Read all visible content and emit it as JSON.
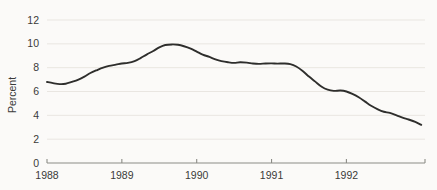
{
  "chart_data": {
    "type": "line",
    "title": "",
    "subtitle": "",
    "xlabel": "",
    "ylabel": "Percent",
    "xlim": [
      1988.0,
      1993.05
    ],
    "ylim": [
      0,
      12
    ],
    "grid": true,
    "legend": false,
    "legend_position": "none",
    "y_ticks": [
      0,
      2,
      4,
      6,
      8,
      10,
      12
    ],
    "y_tick_labels": [
      "0",
      "2",
      "4",
      "6",
      "8",
      "10",
      "12"
    ],
    "x_ticks": [
      1988,
      1989,
      1990,
      1991,
      1992
    ],
    "x_tick_labels": [
      "1988",
      "1989",
      "1990",
      "1991",
      "1992"
    ],
    "series": [
      {
        "name": "Percent",
        "color": "#2e2e2c",
        "x": [
          1988.0,
          1988.08,
          1988.17,
          1988.25,
          1988.33,
          1988.42,
          1988.5,
          1988.58,
          1988.67,
          1988.75,
          1988.83,
          1988.92,
          1989.0,
          1989.08,
          1989.17,
          1989.25,
          1989.33,
          1989.42,
          1989.5,
          1989.58,
          1989.67,
          1989.75,
          1989.83,
          1989.92,
          1990.0,
          1990.08,
          1990.17,
          1990.25,
          1990.33,
          1990.42,
          1990.5,
          1990.58,
          1990.67,
          1990.75,
          1990.83,
          1990.92,
          1991.0,
          1991.08,
          1991.17,
          1991.25,
          1991.33,
          1991.42,
          1991.5,
          1991.58,
          1991.67,
          1991.75,
          1991.83,
          1991.92,
          1992.0,
          1992.08,
          1992.17,
          1992.25,
          1992.33,
          1992.42,
          1992.5,
          1992.58,
          1992.67,
          1992.75,
          1992.83,
          1992.92,
          1993.0
        ],
        "values": [
          6.8,
          6.7,
          6.62,
          6.65,
          6.8,
          7.0,
          7.25,
          7.55,
          7.8,
          8.0,
          8.15,
          8.25,
          8.35,
          8.4,
          8.55,
          8.8,
          9.1,
          9.4,
          9.7,
          9.9,
          9.95,
          9.92,
          9.8,
          9.6,
          9.35,
          9.1,
          8.9,
          8.7,
          8.55,
          8.45,
          8.4,
          8.45,
          8.42,
          8.35,
          8.32,
          8.35,
          8.36,
          8.34,
          8.35,
          8.3,
          8.1,
          7.7,
          7.25,
          6.85,
          6.4,
          6.15,
          6.05,
          6.08,
          6.0,
          5.8,
          5.5,
          5.15,
          4.8,
          4.5,
          4.3,
          4.2,
          4.0,
          3.8,
          3.65,
          3.45,
          3.2
        ]
      }
    ]
  }
}
